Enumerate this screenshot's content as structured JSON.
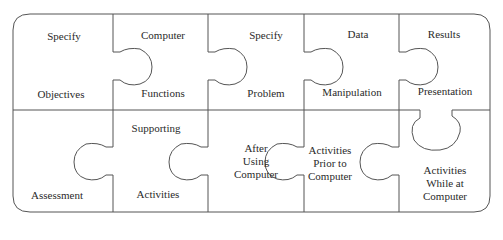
{
  "diagram": {
    "type": "jigsaw-puzzle",
    "rows": [
      {
        "pieces": [
          {
            "top": "Specify",
            "bottom": "Objectives"
          },
          {
            "top": "Computer",
            "bottom": "Functions"
          },
          {
            "top": "Specify",
            "bottom": "Problem"
          },
          {
            "top": "Data",
            "bottom": "Manipulation"
          },
          {
            "top": "Results",
            "bottom": "Presentation"
          }
        ]
      },
      {
        "pieces": [
          {
            "lines": [
              "Assessment"
            ]
          },
          {
            "top": "Supporting",
            "bottom": "Activities"
          },
          {
            "lines": [
              "After",
              "Using",
              "Computer"
            ]
          },
          {
            "lines": [
              "Activities",
              "Prior to",
              "Computer"
            ]
          },
          {
            "lines": [
              "Activities",
              "While at",
              "Computer"
            ]
          }
        ]
      }
    ],
    "colors": {
      "stroke": "#555555",
      "background": "#ffffff",
      "text": "#2a2a2a"
    }
  }
}
